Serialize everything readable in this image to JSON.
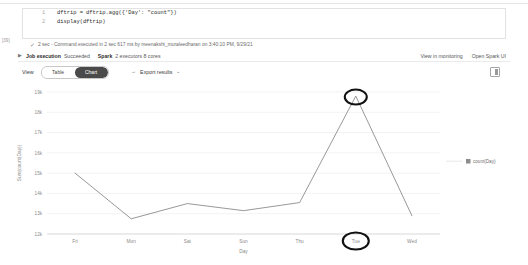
{
  "notebook": {
    "cell_tag": "[39]",
    "code_lines": [
      {
        "num": "1",
        "text": "dftrip = dftrip.agg({'Day': \"count\"})"
      },
      {
        "num": "2",
        "text": "display(dftrip)"
      }
    ],
    "execution": {
      "check_icon": "check-icon",
      "status": "2 sec - Command executed in 2 sec 617 ms by meenakshi_muraleedharan on 3:40:10 PM, 9/29/21"
    }
  },
  "job_bar": {
    "expand_icon": "chevron-right-icon",
    "job_label": "Job execution",
    "job_status": "Succeeded",
    "spark_label": "Spark",
    "spark_detail": "2 executors 8 cores",
    "links": [
      {
        "label": "View in monitoring"
      },
      {
        "label": "Open Spark UI"
      }
    ]
  },
  "toolbar": {
    "view_label": "View",
    "toggle": [
      {
        "label": "Table",
        "active": false
      },
      {
        "label": "Chart",
        "active": true
      }
    ],
    "export_arrow": "→",
    "export_label": "Export results",
    "export_chevron": "⌄",
    "panel_icon": "side-panel-icon"
  },
  "chart_data": {
    "type": "line",
    "title": "",
    "xlabel": "Day",
    "ylabel": "Sum(count(Day))",
    "categories": [
      "Fri",
      "Mon",
      "Sat",
      "Sun",
      "Thu",
      "Tue",
      "Wed"
    ],
    "series": [
      {
        "name": "count(Day)",
        "values": [
          15000,
          12750,
          13500,
          13150,
          13550,
          18800,
          12900
        ],
        "color": "#8c8c8c"
      }
    ],
    "ylim": [
      12000,
      19000
    ],
    "yticks": [
      19000,
      18000,
      17000,
      16000,
      15000,
      14000,
      13000,
      12000
    ],
    "ytick_labels": [
      "19k",
      "18k",
      "17k",
      "16k",
      "15k",
      "14k",
      "13k",
      "12k"
    ],
    "grid": true,
    "legend_position": "right",
    "legend": [
      {
        "label": "count(Day)",
        "color": "#8c8c8c"
      }
    ],
    "annotations": [
      {
        "type": "ellipse-highlight",
        "target": "Tue",
        "at": "peak-point"
      },
      {
        "type": "ellipse-highlight",
        "target": "Tue",
        "at": "x-axis-label"
      }
    ]
  }
}
